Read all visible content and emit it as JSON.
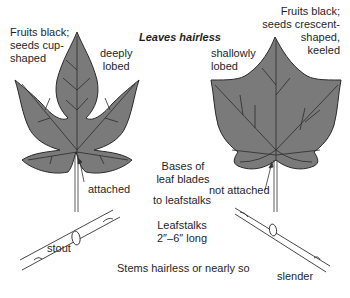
{
  "title": "Leaves hairless",
  "left_plant": {
    "fruit_note_line1": "Fruits black;",
    "fruit_note_line2": "seeds cup-",
    "fruit_note_line3": "shaped",
    "lobing_line1": "deeply",
    "lobing_line2": "lobed",
    "attachment": "attached",
    "stem": "stout"
  },
  "right_plant": {
    "fruit_note_line1": "Fruits black;",
    "fruit_note_line2": "seeds crescent-",
    "fruit_note_line3": "shaped,",
    "fruit_note_line4": "keeled",
    "lobing_line1": "shallowly",
    "lobing_line2": "lobed",
    "attachment": "not attached",
    "stem": "slender"
  },
  "center_notes": {
    "bases_line1": "Bases of",
    "bases_line2": "leaf blades",
    "to_leafstalks": "to leafstalks",
    "leafstalks_line1": "Leafstalks",
    "leafstalks_line2": "2″–6″ long",
    "stems": "Stems hairless or nearly so"
  },
  "colors": {
    "leaf_fill": "#7a7a7a",
    "leaf_outline": "#2a2a2a",
    "text": "#1f1f1f"
  }
}
